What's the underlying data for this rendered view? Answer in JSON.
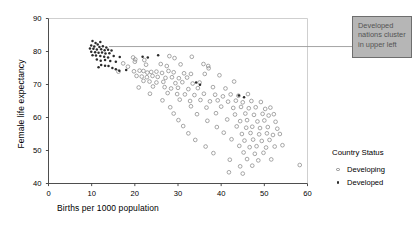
{
  "chart_data": {
    "type": "scatter",
    "title": "",
    "xlabel": "Births per 1000 population",
    "ylabel": "Female life expectancy",
    "xlim": [
      0,
      60
    ],
    "ylim": [
      40,
      90
    ],
    "xticks": [
      0,
      10,
      20,
      30,
      40,
      50,
      60
    ],
    "yticks": [
      40,
      50,
      60,
      70,
      80,
      90
    ],
    "grid": false,
    "legend": {
      "title": "Country Status",
      "position": "right",
      "entries": [
        {
          "label": "Developing",
          "marker": "open-circle",
          "color": "#8a8a8a"
        },
        {
          "label": "Developed",
          "marker": "filled-dot",
          "color": "#2b2b2b"
        }
      ]
    },
    "annotations": [
      {
        "name": "developed-cluster-callout",
        "text": "Developed nations cluster in upper left",
        "lines": [
          "Developed",
          "nations cluster",
          "in upper left"
        ],
        "box_fill": "#b6b6b6",
        "box_border": "#6e6e6e",
        "text_color": "#545454",
        "leader_from": [
          14.0,
          81.5
        ],
        "leader_to": [
          60.0,
          81.5
        ]
      }
    ],
    "series": [
      {
        "name": "Developed",
        "marker": "filled-dot",
        "color": "#2b2b2b",
        "points": [
          [
            10.2,
            83.2
          ],
          [
            10.9,
            82.6
          ],
          [
            12.0,
            82.9
          ],
          [
            11.4,
            82.1
          ],
          [
            9.9,
            81.8
          ],
          [
            10.6,
            81.5
          ],
          [
            11.8,
            81.4
          ],
          [
            12.6,
            81.6
          ],
          [
            13.4,
            81.2
          ],
          [
            9.6,
            80.9
          ],
          [
            10.4,
            80.8
          ],
          [
            11.2,
            80.6
          ],
          [
            12.2,
            80.7
          ],
          [
            13.0,
            80.4
          ],
          [
            13.8,
            80.5
          ],
          [
            14.6,
            80.3
          ],
          [
            9.9,
            79.9
          ],
          [
            10.8,
            79.8
          ],
          [
            11.6,
            79.6
          ],
          [
            12.4,
            79.7
          ],
          [
            13.2,
            79.4
          ],
          [
            14.1,
            79.5
          ],
          [
            10.2,
            78.9
          ],
          [
            11.0,
            78.8
          ],
          [
            12.0,
            78.6
          ],
          [
            12.9,
            78.4
          ],
          [
            13.8,
            78.2
          ],
          [
            15.1,
            78.6
          ],
          [
            16.5,
            78.3
          ],
          [
            11.2,
            77.6
          ],
          [
            12.1,
            77.2
          ],
          [
            13.1,
            77.4
          ],
          [
            14.3,
            77.1
          ],
          [
            15.6,
            76.9
          ],
          [
            21.8,
            78.4
          ],
          [
            23.0,
            78.2
          ],
          [
            25.4,
            78.9
          ],
          [
            12.2,
            75.9
          ],
          [
            13.1,
            75.7
          ],
          [
            13.9,
            75.6
          ],
          [
            11.6,
            75.2
          ],
          [
            14.8,
            75.0
          ],
          [
            15.6,
            74.6
          ],
          [
            16.4,
            74.2
          ],
          [
            18.0,
            74.4
          ],
          [
            44.1,
            66.7
          ],
          [
            45.3,
            66.1
          ],
          [
            34.2,
            70.6
          ],
          [
            35.1,
            69.9
          ]
        ]
      },
      {
        "name": "Developing",
        "marker": "open-circle",
        "color": "#8a8a8a",
        "points": [
          [
            19.6,
            78.2
          ],
          [
            20.1,
            77.6
          ],
          [
            20.0,
            76.9
          ],
          [
            22.2,
            77.4
          ],
          [
            28.0,
            78.6
          ],
          [
            29.2,
            78.0
          ],
          [
            33.2,
            78.4
          ],
          [
            17.3,
            76.4
          ],
          [
            18.4,
            75.4
          ],
          [
            22.6,
            76.0
          ],
          [
            26.0,
            76.2
          ],
          [
            27.4,
            75.6
          ],
          [
            30.6,
            76.1
          ],
          [
            35.9,
            76.2
          ],
          [
            37.0,
            75.6
          ],
          [
            37.1,
            74.9
          ],
          [
            16.2,
            73.9
          ],
          [
            19.8,
            74.0
          ],
          [
            21.1,
            74.2
          ],
          [
            22.0,
            74.1
          ],
          [
            22.9,
            73.6
          ],
          [
            23.8,
            73.8
          ],
          [
            25.0,
            73.9
          ],
          [
            26.3,
            73.5
          ],
          [
            27.8,
            74.1
          ],
          [
            29.0,
            73.7
          ],
          [
            31.4,
            73.4
          ],
          [
            33.0,
            73.2
          ],
          [
            36.2,
            73.2
          ],
          [
            20.4,
            72.6
          ],
          [
            21.6,
            72.4
          ],
          [
            22.8,
            72.2
          ],
          [
            24.1,
            72.6
          ],
          [
            25.3,
            72.3
          ],
          [
            27.1,
            72.0
          ],
          [
            28.6,
            72.2
          ],
          [
            30.2,
            71.9
          ],
          [
            32.1,
            72.1
          ],
          [
            39.6,
            72.8
          ],
          [
            22.0,
            71.1
          ],
          [
            23.4,
            70.9
          ],
          [
            25.0,
            70.6
          ],
          [
            26.6,
            70.8
          ],
          [
            29.4,
            70.4
          ],
          [
            31.0,
            70.7
          ],
          [
            33.4,
            70.3
          ],
          [
            35.0,
            70.6
          ],
          [
            43.0,
            70.9
          ],
          [
            20.9,
            69.1
          ],
          [
            24.2,
            69.4
          ],
          [
            26.9,
            69.2
          ],
          [
            28.4,
            68.8
          ],
          [
            30.0,
            69.0
          ],
          [
            32.4,
            68.6
          ],
          [
            34.6,
            68.9
          ],
          [
            38.1,
            69.2
          ],
          [
            41.0,
            68.8
          ],
          [
            23.5,
            67.2
          ],
          [
            27.6,
            67.4
          ],
          [
            29.8,
            67.1
          ],
          [
            31.6,
            67.0
          ],
          [
            33.8,
            66.8
          ],
          [
            36.0,
            67.2
          ],
          [
            38.6,
            66.9
          ],
          [
            40.4,
            66.4
          ],
          [
            42.2,
            67.0
          ],
          [
            44.0,
            66.6
          ],
          [
            46.2,
            67.1
          ],
          [
            26.4,
            65.2
          ],
          [
            30.4,
            65.4
          ],
          [
            32.8,
            65.0
          ],
          [
            35.2,
            65.3
          ],
          [
            37.4,
            64.9
          ],
          [
            39.2,
            65.2
          ],
          [
            41.6,
            64.8
          ],
          [
            43.4,
            65.1
          ],
          [
            45.0,
            64.6
          ],
          [
            47.0,
            65.0
          ],
          [
            49.2,
            64.7
          ],
          [
            28.2,
            63.1
          ],
          [
            33.0,
            63.4
          ],
          [
            36.6,
            63.0
          ],
          [
            40.0,
            63.3
          ],
          [
            42.8,
            62.9
          ],
          [
            44.6,
            63.2
          ],
          [
            46.4,
            62.8
          ],
          [
            48.0,
            63.1
          ],
          [
            50.2,
            62.6
          ],
          [
            51.4,
            63.0
          ],
          [
            29.0,
            61.2
          ],
          [
            34.4,
            61.0
          ],
          [
            38.8,
            61.3
          ],
          [
            43.2,
            60.9
          ],
          [
            45.6,
            61.2
          ],
          [
            47.6,
            60.8
          ],
          [
            49.6,
            61.1
          ],
          [
            51.0,
            60.6
          ],
          [
            52.2,
            61.0
          ],
          [
            30.1,
            59.2
          ],
          [
            36.8,
            59.0
          ],
          [
            41.4,
            59.4
          ],
          [
            44.4,
            58.9
          ],
          [
            46.0,
            59.2
          ],
          [
            48.4,
            58.8
          ],
          [
            50.0,
            59.1
          ],
          [
            52.6,
            58.7
          ],
          [
            31.2,
            57.4
          ],
          [
            39.0,
            57.1
          ],
          [
            43.6,
            57.3
          ],
          [
            45.8,
            56.9
          ],
          [
            47.2,
            57.2
          ],
          [
            49.0,
            56.8
          ],
          [
            50.8,
            57.1
          ],
          [
            53.0,
            56.6
          ],
          [
            32.4,
            55.2
          ],
          [
            40.6,
            55.4
          ],
          [
            44.8,
            55.0
          ],
          [
            46.8,
            55.3
          ],
          [
            48.8,
            54.9
          ],
          [
            50.6,
            55.2
          ],
          [
            52.0,
            54.7
          ],
          [
            53.6,
            55.0
          ],
          [
            34.0,
            53.2
          ],
          [
            42.4,
            53.4
          ],
          [
            45.4,
            53.0
          ],
          [
            47.4,
            53.3
          ],
          [
            49.4,
            52.9
          ],
          [
            51.2,
            53.2
          ],
          [
            36.4,
            51.2
          ],
          [
            44.2,
            51.4
          ],
          [
            46.6,
            51.0
          ],
          [
            48.2,
            51.3
          ],
          [
            50.4,
            50.9
          ],
          [
            52.4,
            51.2
          ],
          [
            54.2,
            51.6
          ],
          [
            38.2,
            49.2
          ],
          [
            45.2,
            49.4
          ],
          [
            47.8,
            49.0
          ],
          [
            49.8,
            49.3
          ],
          [
            42.0,
            47.2
          ],
          [
            46.0,
            47.4
          ],
          [
            48.6,
            47.0
          ],
          [
            51.6,
            47.3
          ],
          [
            44.4,
            45.2
          ],
          [
            47.2,
            45.4
          ],
          [
            58.2,
            45.6
          ],
          [
            41.8,
            43.4
          ],
          [
            45.0,
            43.0
          ]
        ]
      }
    ]
  },
  "axes": {
    "y_title": "Female life expectancy",
    "x_title": "Births per 1000 population"
  }
}
